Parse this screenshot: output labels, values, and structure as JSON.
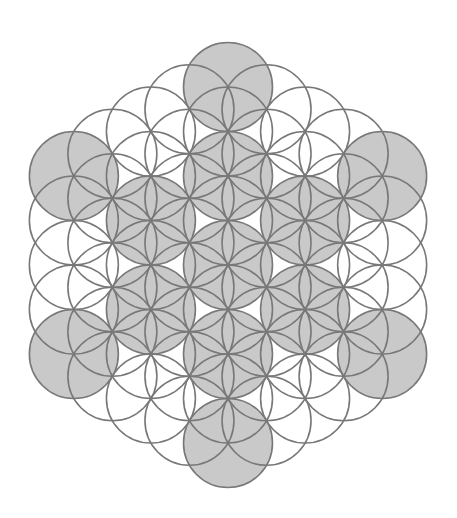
{
  "figure": {
    "width": 457,
    "height": 518,
    "background": "#ffffff",
    "center": [
      228,
      265
    ],
    "radius": 44.5,
    "lattice_rings": 4,
    "circle_count": 61,
    "stroke_color": "#787878",
    "stroke_width": 1.6,
    "highlight_fill": "#c9c9c9",
    "plain_fill": "none",
    "highlighted_circles": {
      "description": "Fruit of Life: center, 6 at 2 lattice steps, 6 at 4 lattice steps",
      "lattice_coords": [
        [
          0,
          0
        ],
        [
          2,
          0
        ],
        [
          -2,
          0
        ],
        [
          0,
          2
        ],
        [
          0,
          -2
        ],
        [
          2,
          -2
        ],
        [
          -2,
          2
        ],
        [
          4,
          0
        ],
        [
          -4,
          0
        ],
        [
          0,
          4
        ],
        [
          0,
          -4
        ],
        [
          4,
          -4
        ],
        [
          -4,
          4
        ]
      ]
    }
  }
}
